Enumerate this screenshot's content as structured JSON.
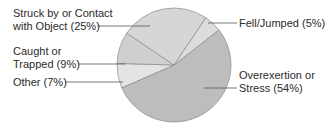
{
  "chart_data": {
    "type": "pie",
    "title": "",
    "slices": [
      {
        "label": "Overexertion or Stress",
        "value": 54,
        "color": "#bdbdbd"
      },
      {
        "label": "Other",
        "value": 7,
        "color": "#e4e4e4"
      },
      {
        "label": "Caught or Trapped",
        "value": 9,
        "color": "#cfcfcf"
      },
      {
        "label": "Struck by or Contact with Object",
        "value": 25,
        "color": "#d6d6d6"
      },
      {
        "label": "Fell/Jumped",
        "value": 5,
        "color": "#dcdcdc"
      }
    ],
    "legend": "callout labels with leader lines",
    "unit": "%"
  },
  "labels": {
    "struck_line1": "Struck by or Contact",
    "struck_line2": "with Object (25%)",
    "caught_line1": "Caught or",
    "caught_line2": "Trapped (9%)",
    "other": "Other (7%)",
    "fell": "Fell/Jumped (5%)",
    "over_line1": "Overexertion or",
    "over_line2": "Stress (54%)"
  }
}
